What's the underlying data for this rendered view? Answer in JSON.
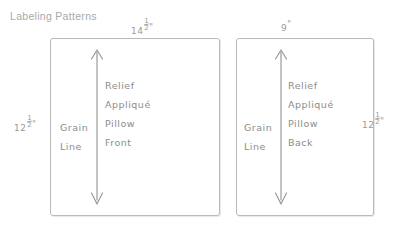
{
  "page": {
    "title": "Labeling Patterns",
    "background_color": "#ffffff",
    "ink_color": "#8c8c8c",
    "title_color": "#a9a9a9",
    "outline_color": "#b9b9b9",
    "width": 405,
    "height": 229
  },
  "pieces": [
    {
      "id": "pillow-front",
      "name": "Relief Appliqué Pillow Front",
      "top_dimension": {
        "whole": "14",
        "numerator": "1",
        "denominator": "2",
        "unit": "\""
      },
      "side_dimension": {
        "whole": "12",
        "numerator": "1",
        "denominator": "2",
        "unit": "\""
      },
      "side_dimension_position": "left",
      "grain_line_label": {
        "line1": "Grain",
        "line2": "Line"
      },
      "grain_line_arrow": "double-headed-vertical-arrow",
      "label_lines": [
        "Relief",
        "Appliqué",
        "Pillow",
        "Front"
      ]
    },
    {
      "id": "pillow-back",
      "name": "Relief Appliqué Pillow Back",
      "top_dimension": {
        "whole": "9",
        "numerator": "",
        "denominator": "",
        "unit": "\""
      },
      "side_dimension": {
        "whole": "12",
        "numerator": "1",
        "denominator": "2",
        "unit": "\""
      },
      "side_dimension_position": "right",
      "grain_line_label": {
        "line1": "Grain",
        "line2": "Line"
      },
      "grain_line_arrow": "double-headed-vertical-arrow",
      "label_lines": [
        "Relief",
        "Appliqué",
        "Pillow",
        "Back"
      ]
    }
  ]
}
